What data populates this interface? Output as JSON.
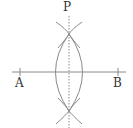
{
  "diagram": {
    "type": "perpendicular-bisector-construction",
    "labels": {
      "p": "P",
      "a": "A",
      "b": "B"
    },
    "colors": {
      "line": "#8a8a8a",
      "text": "#333333"
    }
  }
}
